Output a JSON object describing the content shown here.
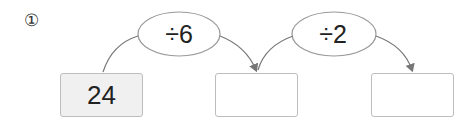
{
  "problem_number": "①",
  "operations": [
    "÷6",
    "÷2"
  ],
  "boxes": [
    "24",
    "",
    ""
  ]
}
